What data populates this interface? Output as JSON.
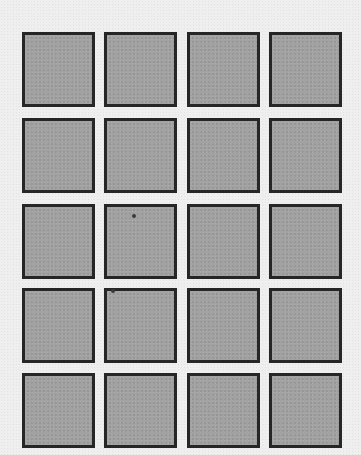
{
  "grid": {
    "rows": 5,
    "columns": 4,
    "column_x": [
      22,
      104,
      187,
      269
    ],
    "row_y": [
      32,
      118,
      204,
      288,
      373
    ],
    "tile_width": 73,
    "tile_height": 75
  },
  "colors": {
    "background": "#efefef",
    "tile_fill": "#a2a2a2",
    "tile_border": "#262626"
  },
  "specks": [
    {
      "x": 132,
      "y": 214
    },
    {
      "x": 111,
      "y": 289
    }
  ]
}
